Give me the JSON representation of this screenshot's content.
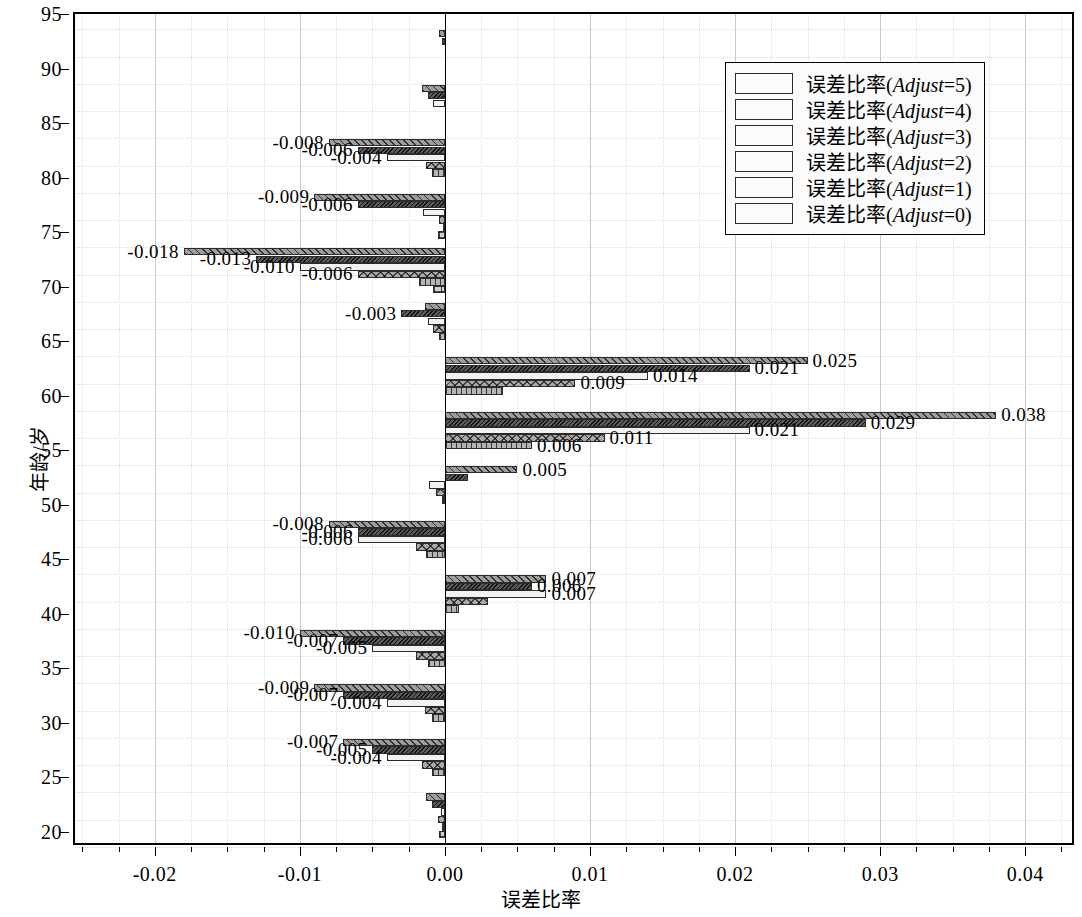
{
  "chart": {
    "type": "bar",
    "orientation": "horizontal",
    "title": "",
    "xlabel": "误差比率",
    "ylabel": "年龄/岁",
    "xlim": [
      -0.0255,
      0.0435
    ],
    "ylim": [
      18.6,
      95
    ],
    "xticks": [
      -0.02,
      -0.01,
      0.0,
      0.01,
      0.02,
      0.03,
      0.04
    ],
    "xtick_labels": [
      "-0.02",
      "-0.01",
      "0.00",
      "0.01",
      "0.02",
      "0.03",
      "0.04"
    ],
    "yticks": [
      20,
      25,
      30,
      35,
      40,
      45,
      50,
      55,
      60,
      65,
      70,
      75,
      80,
      85,
      90,
      95
    ],
    "ytick_labels": [
      "20",
      "25",
      "30",
      "35",
      "40",
      "45",
      "50",
      "55",
      "60",
      "65",
      "70",
      "75",
      "80",
      "85",
      "90",
      "95"
    ],
    "grid": true,
    "legend_position": "upper right",
    "zero_reference_line": 0.0
  },
  "legend": {
    "items": [
      {
        "key": "adjust5",
        "prefix": "误差比率(",
        "var": "Adjust",
        "suffix": "=5)",
        "pattern": "diagonal-hatch"
      },
      {
        "key": "adjust4",
        "prefix": "误差比率(",
        "var": "Adjust",
        "suffix": "=4)",
        "pattern": "dense-dark"
      },
      {
        "key": "adjust3",
        "prefix": "误差比率(",
        "var": "Adjust",
        "suffix": "=3)",
        "pattern": "solid-white"
      },
      {
        "key": "adjust2",
        "prefix": "误差比率(",
        "var": "Adjust",
        "suffix": "=2)",
        "pattern": "cross-diamond"
      },
      {
        "key": "adjust1",
        "prefix": "误差比率(",
        "var": "Adjust",
        "suffix": "=1)",
        "pattern": "vertical-lines"
      },
      {
        "key": "adjust0",
        "prefix": "误差比率(",
        "var": "Adjust",
        "suffix": "=0)",
        "pattern": "grid-mesh"
      }
    ]
  },
  "chart_data": {
    "type": "bar",
    "orientation": "horizontal",
    "title": "",
    "xlabel": "误差比率",
    "ylabel": "年龄/岁",
    "xlim": [
      -0.0255,
      0.0435
    ],
    "ylim": [
      18.6,
      95
    ],
    "categories": [
      92,
      87,
      82,
      77,
      72,
      67,
      62,
      57,
      52,
      47,
      42,
      37,
      32,
      27,
      22
    ],
    "series": [
      {
        "name": "误差比率(Adjust=5)",
        "pattern": "diagonal-hatch",
        "values": [
          -0.0004,
          -0.0016,
          -0.008,
          -0.009,
          -0.018,
          -0.0014,
          0.025,
          0.038,
          0.005,
          -0.008,
          0.007,
          -0.01,
          -0.009,
          -0.007,
          -0.0013
        ]
      },
      {
        "name": "误差比率(Adjust=4)",
        "pattern": "dense-dark",
        "values": [
          -0.0002,
          -0.0012,
          -0.006,
          -0.006,
          -0.013,
          -0.003,
          0.021,
          0.029,
          0.0016,
          -0.006,
          0.006,
          -0.007,
          -0.007,
          -0.005,
          -0.0009
        ]
      },
      {
        "name": "误差比率(Adjust=3)",
        "pattern": "solid-white",
        "values": [
          0.0,
          -0.0008,
          -0.004,
          -0.0015,
          -0.01,
          -0.0012,
          0.014,
          0.021,
          -0.0011,
          -0.006,
          0.007,
          -0.005,
          -0.004,
          -0.004,
          -0.0003
        ]
      },
      {
        "name": "误差比率(Adjust=2)",
        "pattern": "cross-diamond",
        "values": [
          0.0,
          0.0,
          -0.0013,
          -0.0004,
          -0.006,
          -0.0008,
          0.009,
          0.011,
          -0.0006,
          -0.002,
          0.003,
          -0.002,
          -0.0014,
          -0.0016,
          -0.0005
        ]
      },
      {
        "name": "误差比率(Adjust=1)",
        "pattern": "vertical-lines",
        "values": [
          0.0,
          0.0,
          -0.0009,
          -0.0001,
          -0.0018,
          -0.0004,
          0.004,
          0.006,
          -0.0002,
          -0.0013,
          0.001,
          -0.0012,
          -0.0009,
          -0.0009,
          -0.0002
        ]
      },
      {
        "name": "误差比率(Adjust=0)",
        "pattern": "grid-mesh",
        "values": [
          0.0,
          0.0,
          0.0,
          -0.0005,
          -0.0008,
          0.0,
          0.0,
          0.0,
          0.0,
          0.0,
          0.0,
          0.0,
          0.0,
          0.0,
          -0.0004
        ]
      }
    ],
    "data_labels": [
      {
        "text": "-0.008",
        "value": -0.008,
        "category": 82,
        "series": "误差比率(Adjust=5)"
      },
      {
        "text": "-0.006",
        "value": -0.006,
        "category": 82,
        "series": "误差比率(Adjust=4)"
      },
      {
        "text": "-0.004",
        "value": -0.004,
        "category": 82,
        "series": "误差比率(Adjust=3)"
      },
      {
        "text": "-0.009",
        "value": -0.009,
        "category": 77,
        "series": "误差比率(Adjust=5)"
      },
      {
        "text": "-0.006",
        "value": -0.006,
        "category": 77,
        "series": "误差比率(Adjust=4)"
      },
      {
        "text": "-0.018",
        "value": -0.018,
        "category": 72,
        "series": "误差比率(Adjust=5)"
      },
      {
        "text": "-0.013",
        "value": -0.013,
        "category": 72,
        "series": "误差比率(Adjust=4)"
      },
      {
        "text": "-0.010",
        "value": -0.01,
        "category": 72,
        "series": "误差比率(Adjust=3)"
      },
      {
        "text": "-0.006",
        "value": -0.006,
        "category": 72,
        "series": "误差比率(Adjust=2)"
      },
      {
        "text": "-0.003",
        "value": -0.003,
        "category": 67,
        "series": "误差比率(Adjust=4)"
      },
      {
        "text": "0.025",
        "value": 0.025,
        "category": 62,
        "series": "误差比率(Adjust=5)"
      },
      {
        "text": "0.021",
        "value": 0.021,
        "category": 62,
        "series": "误差比率(Adjust=4)"
      },
      {
        "text": "0.014",
        "value": 0.014,
        "category": 62,
        "series": "误差比率(Adjust=3)"
      },
      {
        "text": "0.009",
        "value": 0.009,
        "category": 62,
        "series": "误差比率(Adjust=2)"
      },
      {
        "text": "0.038",
        "value": 0.038,
        "category": 57,
        "series": "误差比率(Adjust=5)"
      },
      {
        "text": "0.029",
        "value": 0.029,
        "category": 57,
        "series": "误差比率(Adjust=4)"
      },
      {
        "text": "0.021",
        "value": 0.021,
        "category": 57,
        "series": "误差比率(Adjust=3)"
      },
      {
        "text": "0.011",
        "value": 0.011,
        "category": 57,
        "series": "误差比率(Adjust=2)"
      },
      {
        "text": "0.006",
        "value": 0.006,
        "category": 57,
        "series": "误差比率(Adjust=1)"
      },
      {
        "text": "0.005",
        "value": 0.005,
        "category": 52,
        "series": "误差比率(Adjust=5)"
      },
      {
        "text": "-0.008",
        "value": -0.008,
        "category": 47,
        "series": "误差比率(Adjust=5)"
      },
      {
        "text": "-0.006",
        "value": -0.006,
        "category": 47,
        "series": "误差比率(Adjust=4)"
      },
      {
        "text": "-0.006",
        "value": -0.006,
        "category": 47,
        "series": "误差比率(Adjust=3)"
      },
      {
        "text": "0.007",
        "value": 0.007,
        "category": 42,
        "series": "误差比率(Adjust=5)"
      },
      {
        "text": "0.006",
        "value": 0.006,
        "category": 42,
        "series": "误差比率(Adjust=4)"
      },
      {
        "text": "0.007",
        "value": 0.007,
        "category": 42,
        "series": "误差比率(Adjust=3)"
      },
      {
        "text": "-0.010",
        "value": -0.01,
        "category": 37,
        "series": "误差比率(Adjust=5)"
      },
      {
        "text": "-0.007",
        "value": -0.007,
        "category": 37,
        "series": "误差比率(Adjust=4)"
      },
      {
        "text": "-0.005",
        "value": -0.005,
        "category": 37,
        "series": "误差比率(Adjust=3)"
      },
      {
        "text": "-0.009",
        "value": -0.009,
        "category": 32,
        "series": "误差比率(Adjust=5)"
      },
      {
        "text": "-0.007",
        "value": -0.007,
        "category": 32,
        "series": "误差比率(Adjust=4)"
      },
      {
        "text": "-0.004",
        "value": -0.004,
        "category": 32,
        "series": "误差比率(Adjust=3)"
      },
      {
        "text": "-0.007",
        "value": -0.007,
        "category": 27,
        "series": "误差比率(Adjust=5)"
      },
      {
        "text": "-0.005",
        "value": -0.005,
        "category": 27,
        "series": "误差比率(Adjust=4)"
      },
      {
        "text": "-0.004",
        "value": -0.004,
        "category": 27,
        "series": "误差比率(Adjust=3)"
      }
    ]
  }
}
